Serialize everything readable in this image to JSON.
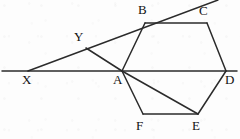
{
  "figure": {
    "width": 240,
    "height": 139,
    "background_color": "#fdfdfd",
    "stroke_color": "#2b2b2b",
    "label_color": "#111111"
  },
  "labels": [
    {
      "id": "label-X",
      "text": "X",
      "x": 22,
      "y": 73
    },
    {
      "id": "label-Y",
      "text": "Y",
      "x": 74,
      "y": 30
    },
    {
      "id": "label-A",
      "text": "A",
      "x": 113,
      "y": 73
    },
    {
      "id": "label-B",
      "text": "B",
      "x": 138,
      "y": 3
    },
    {
      "id": "label-C",
      "text": "C",
      "x": 199,
      "y": 4
    },
    {
      "id": "label-D",
      "text": "D",
      "x": 225,
      "y": 73
    },
    {
      "id": "label-E",
      "text": "E",
      "x": 192,
      "y": 119
    },
    {
      "id": "label-F",
      "text": "F",
      "x": 136,
      "y": 119
    }
  ],
  "points": {
    "X": {
      "x": 28,
      "y": 71
    },
    "Y": {
      "x": 86,
      "y": 48
    },
    "A": {
      "x": 122,
      "y": 71
    },
    "B": {
      "x": 145,
      "y": 23
    },
    "C": {
      "x": 207,
      "y": 23
    },
    "D": {
      "x": 226,
      "y": 71
    },
    "E": {
      "x": 198,
      "y": 114
    },
    "F": {
      "x": 143,
      "y": 114
    },
    "line_left_end": {
      "x": 2,
      "y": 71
    },
    "line_right_end": {
      "x": 237,
      "y": 71
    },
    "ray_top_end": {
      "x": 218,
      "y": 0
    }
  },
  "segments": [
    {
      "id": "horizontal-baseline",
      "from": "line_left_end",
      "to": "line_right_end",
      "width": 1.5
    },
    {
      "id": "transversal-ray",
      "from": "X",
      "to": "ray_top_end",
      "width": 1.5
    },
    {
      "id": "segment-Y-A",
      "from": "Y",
      "to": "A",
      "width": 1.5
    },
    {
      "id": "hexagon-edge-A-B",
      "from": "A",
      "to": "B",
      "width": 1.5
    },
    {
      "id": "hexagon-edge-B-C",
      "from": "B",
      "to": "C",
      "width": 1.5
    },
    {
      "id": "hexagon-edge-C-D",
      "from": "C",
      "to": "D",
      "width": 1.5
    },
    {
      "id": "hexagon-edge-D-E",
      "from": "D",
      "to": "E",
      "width": 1.5
    },
    {
      "id": "hexagon-edge-E-F",
      "from": "E",
      "to": "F",
      "width": 1.5
    },
    {
      "id": "hexagon-edge-F-A",
      "from": "F",
      "to": "A",
      "width": 1.5
    },
    {
      "id": "diagonal-A-E",
      "from": "A",
      "to": "E",
      "width": 1.5
    }
  ]
}
